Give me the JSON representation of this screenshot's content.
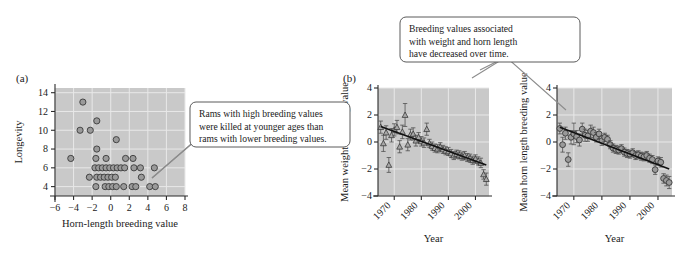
{
  "figure": {
    "background_color": "#ffffff",
    "plot_background_color": "#c9c9c9",
    "marker_color": "#9a9a9a",
    "trendline_color": "#111111",
    "leader_color": "#8c8c8c"
  },
  "panels": {
    "a": {
      "label": "(a)",
      "callout": {
        "lines": [
          "Rams with high breeding values",
          "were killed at younger ages than",
          "rams with lower breeding values."
        ]
      }
    },
    "b": {
      "label": "(b)"
    },
    "c": {
      "label": ""
    },
    "top_callout": {
      "lines": [
        "Breeding values associated",
        "with weight and horn length",
        "have decreased over time."
      ]
    }
  },
  "chart_data": [
    {
      "id": "panel-a-longevity-scatter",
      "type": "scatter",
      "title": "",
      "panel_label": "(a)",
      "xlabel": "Horn-length breeding value",
      "ylabel": "Longevity",
      "xlim": [
        -6,
        8
      ],
      "ylim": [
        3,
        14.5
      ],
      "xticks": [
        -6,
        -4,
        -2,
        0,
        2,
        4,
        6,
        8
      ],
      "xtick_labels": [
        "−6",
        "−4",
        "−2",
        "0",
        "2",
        "4",
        "6",
        "8"
      ],
      "yticks": [
        4,
        6,
        8,
        10,
        12,
        14
      ],
      "ytick_labels": [
        "4",
        "6",
        "8",
        "10",
        "12",
        "14"
      ],
      "grid": true,
      "legend": "none",
      "points": [
        [
          -3.0,
          13
        ],
        [
          -1.5,
          11
        ],
        [
          -3.3,
          10
        ],
        [
          -2.2,
          10
        ],
        [
          0.6,
          9
        ],
        [
          -1.5,
          8
        ],
        [
          -4.3,
          7
        ],
        [
          -1.6,
          7
        ],
        [
          -0.5,
          7
        ],
        [
          1.6,
          7
        ],
        [
          2.4,
          7
        ],
        [
          -1.7,
          6
        ],
        [
          -1.3,
          6
        ],
        [
          -0.9,
          6
        ],
        [
          -0.5,
          6
        ],
        [
          -0.1,
          6
        ],
        [
          0.3,
          6
        ],
        [
          0.7,
          6
        ],
        [
          1.1,
          6
        ],
        [
          1.5,
          6
        ],
        [
          2.5,
          6
        ],
        [
          3.2,
          6
        ],
        [
          4.7,
          6
        ],
        [
          -2.3,
          5
        ],
        [
          -1.5,
          5
        ],
        [
          -1.1,
          5
        ],
        [
          -0.7,
          5
        ],
        [
          -0.3,
          5
        ],
        [
          0.1,
          5
        ],
        [
          0.5,
          5
        ],
        [
          3.3,
          5
        ],
        [
          -1.6,
          4
        ],
        [
          -0.6,
          4
        ],
        [
          -0.2,
          4
        ],
        [
          0.2,
          4
        ],
        [
          0.6,
          4
        ],
        [
          1.4,
          4
        ],
        [
          2.3,
          4
        ],
        [
          2.7,
          4
        ],
        [
          4.2,
          4
        ],
        [
          4.8,
          4
        ]
      ]
    },
    {
      "id": "panel-b-mean-weight-breeding-value",
      "type": "scatter",
      "panel_label": "(b)",
      "marker": "triangle",
      "error_bars": true,
      "title": "",
      "xlabel": "Year",
      "ylabel": "Mean weight breeding value",
      "xlim": [
        1964,
        2005
      ],
      "ylim": [
        -4,
        4
      ],
      "xticks": [
        1970,
        1980,
        1990,
        2000
      ],
      "xtick_labels": [
        "1970",
        "1980",
        "1990",
        "2000"
      ],
      "yticks": [
        -4,
        -2,
        0,
        2,
        4
      ],
      "ytick_labels": [
        "−4",
        "−2",
        "0",
        "2",
        "4"
      ],
      "grid": true,
      "trendline": {
        "x": [
          1965,
          2004
        ],
        "y": [
          1.15,
          -1.7
        ]
      },
      "x": [
        1965,
        1966,
        1967,
        1968,
        1969,
        1970,
        1971,
        1972,
        1973,
        1974,
        1975,
        1976,
        1977,
        1978,
        1979,
        1980,
        1981,
        1982,
        1983,
        1984,
        1985,
        1986,
        1987,
        1988,
        1989,
        1990,
        1991,
        1992,
        1993,
        1994,
        1995,
        1996,
        1997,
        1998,
        1999,
        2000,
        2001,
        2002,
        2003,
        2004
      ],
      "y": [
        1.1,
        -0.1,
        0.7,
        -1.7,
        0.5,
        0.9,
        1.1,
        -0.35,
        0.75,
        2.0,
        -0.2,
        0.55,
        0.6,
        0.1,
        0.35,
        0.05,
        -0.05,
        0.95,
        -0.1,
        -0.3,
        -0.45,
        -0.5,
        -0.35,
        -0.55,
        -0.65,
        -0.7,
        -0.85,
        -1.0,
        -0.9,
        -0.95,
        -1.05,
        -1.0,
        -1.15,
        -1.2,
        -1.35,
        -1.25,
        -1.4,
        -1.55,
        -2.4,
        -2.75
      ],
      "yerr": [
        0.45,
        0.6,
        0.5,
        0.55,
        0.5,
        0.45,
        0.5,
        0.45,
        0.5,
        0.85,
        0.45,
        0.4,
        0.45,
        0.4,
        0.35,
        0.35,
        0.35,
        0.45,
        0.3,
        0.3,
        0.3,
        0.3,
        0.3,
        0.3,
        0.3,
        0.3,
        0.3,
        0.3,
        0.3,
        0.3,
        0.3,
        0.3,
        0.3,
        0.3,
        0.3,
        0.3,
        0.3,
        0.35,
        0.35,
        0.45
      ]
    },
    {
      "id": "panel-c-mean-horn-length-breeding-value",
      "type": "scatter",
      "panel_label": "",
      "marker": "circle",
      "error_bars": true,
      "title": "",
      "xlabel": "Year",
      "ylabel": "Mean horn length breeding value",
      "xlim": [
        1964,
        2005
      ],
      "ylim": [
        -4,
        4
      ],
      "xticks": [
        1970,
        1980,
        1990,
        2000
      ],
      "xtick_labels": [
        "1970",
        "1980",
        "1990",
        "2000"
      ],
      "yticks": [
        -4,
        -2,
        0,
        2,
        4
      ],
      "ytick_labels": [
        "−4",
        "−2",
        "0",
        "2",
        "4"
      ],
      "grid": true,
      "trendline": {
        "x": [
          1965,
          2004
        ],
        "y": [
          1.1,
          -2.0
        ]
      },
      "x": [
        1965,
        1966,
        1967,
        1968,
        1969,
        1970,
        1971,
        1972,
        1973,
        1974,
        1975,
        1976,
        1977,
        1978,
        1979,
        1980,
        1981,
        1982,
        1983,
        1984,
        1985,
        1986,
        1987,
        1988,
        1989,
        1990,
        1991,
        1992,
        1993,
        1994,
        1995,
        1996,
        1997,
        1998,
        1999,
        2000,
        2001,
        2002,
        2003,
        2004
      ],
      "y": [
        1.0,
        -0.2,
        0.65,
        -1.3,
        0.35,
        0.6,
        0.4,
        0.15,
        0.95,
        0.5,
        0.45,
        0.8,
        0.7,
        0.35,
        0.6,
        0.1,
        0.35,
        0.2,
        -0.2,
        -0.45,
        -0.55,
        -0.6,
        -0.5,
        -0.75,
        -0.85,
        -0.9,
        -0.8,
        -1.0,
        -0.95,
        -1.05,
        -1.1,
        -1.0,
        -1.2,
        -1.3,
        -2.05,
        -1.4,
        -1.5,
        -2.7,
        -2.85,
        -3.0
      ],
      "yerr": [
        0.4,
        0.55,
        0.45,
        0.5,
        0.5,
        0.8,
        0.45,
        0.45,
        0.45,
        0.45,
        0.4,
        0.45,
        0.4,
        0.35,
        0.35,
        0.35,
        0.3,
        0.3,
        0.3,
        0.3,
        0.3,
        0.3,
        0.3,
        0.3,
        0.3,
        0.3,
        0.3,
        0.3,
        0.3,
        0.3,
        0.3,
        0.3,
        0.3,
        0.3,
        0.35,
        0.3,
        0.35,
        0.35,
        0.4,
        0.45
      ]
    }
  ]
}
